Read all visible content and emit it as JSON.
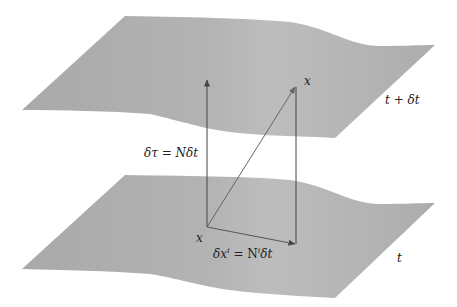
{
  "figure": {
    "colors": {
      "background": "#ffffff",
      "surface_fill": "#b4b4b4",
      "surface_fill_light": "#c0c0c0",
      "surface_fill_dark": "#a8a8a8",
      "arrow_color": "#444444",
      "diagonal_arrow_color": "#666666",
      "text_color": "#222222"
    },
    "surfaces": [
      {
        "id": "upper",
        "label": "t + δt"
      },
      {
        "id": "lower",
        "label": "t"
      }
    ],
    "points": {
      "upper_point_label": "x",
      "lower_point_label": "x"
    },
    "vectors": {
      "lapse": {
        "label": "δτ = Nδt"
      },
      "shift": {
        "label_main": "δx",
        "label_sup": "i",
        "label_eq": " = N",
        "label_sup2": "i",
        "label_tail": "δt"
      }
    }
  }
}
